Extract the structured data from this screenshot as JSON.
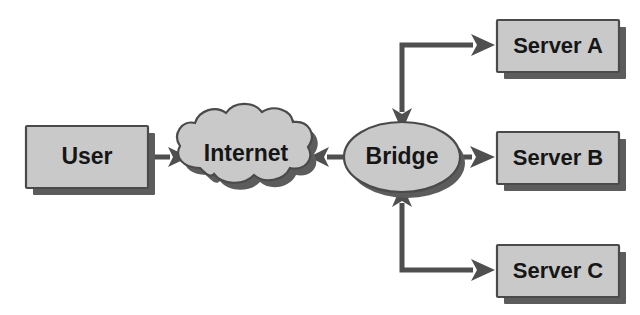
{
  "diagram": {
    "background_color": "#ffffff",
    "shape_fill_color": "#c9c9c9",
    "shape_border_color": "#4a4a4a",
    "shape_shadow_color": "#5c5c5c",
    "connector_color": "#4f4f4f",
    "label_color": "#161616",
    "nodes": [
      {
        "id": "user",
        "label": "User",
        "shape": "rectangle"
      },
      {
        "id": "internet",
        "label": "Internet",
        "shape": "cloud"
      },
      {
        "id": "bridge",
        "label": "Bridge",
        "shape": "ellipse"
      },
      {
        "id": "server_a",
        "label": "Server A",
        "shape": "rectangle"
      },
      {
        "id": "server_b",
        "label": "Server B",
        "shape": "rectangle"
      },
      {
        "id": "server_c",
        "label": "Server C",
        "shape": "rectangle"
      }
    ],
    "connections": [
      {
        "id": "user-to-internet",
        "from": "user",
        "to": "internet",
        "style": "straight",
        "arrowheads": "end"
      },
      {
        "id": "bridge-to-internet",
        "from": "bridge",
        "to": "internet",
        "style": "straight",
        "arrowheads": "end"
      },
      {
        "id": "bridge-to-server-a",
        "from": "bridge",
        "to": "server_a",
        "style": "elbow",
        "arrowheads": "both"
      },
      {
        "id": "bridge-to-server-b",
        "from": "bridge",
        "to": "server_b",
        "style": "straight",
        "arrowheads": "end"
      },
      {
        "id": "bridge-to-server-c",
        "from": "bridge",
        "to": "server_c",
        "style": "elbow",
        "arrowheads": "both"
      }
    ]
  }
}
